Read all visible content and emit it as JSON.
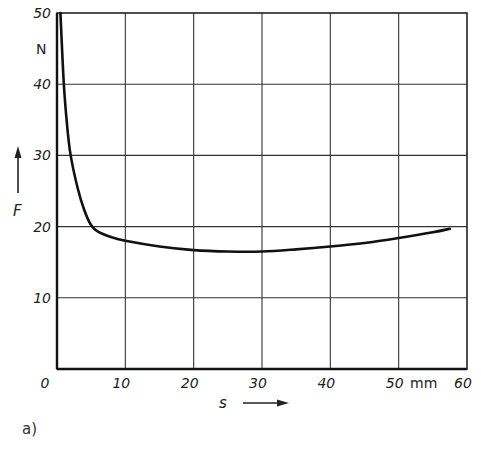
{
  "chart_data": {
    "type": "line",
    "title": "",
    "xlabel": "s",
    "xunit": "mm",
    "ylabel": "F",
    "yunit": "N",
    "xlim": [
      0,
      60
    ],
    "ylim": [
      0,
      50
    ],
    "xticks": [
      0,
      10,
      20,
      30,
      40,
      50,
      60
    ],
    "yticks": [
      10,
      20,
      30,
      40,
      50
    ],
    "grid": true,
    "series": [
      {
        "name": "F(s)",
        "x": [
          0.5,
          1,
          1.5,
          2,
          3,
          4,
          5,
          6,
          8,
          10,
          15,
          20,
          25,
          30,
          35,
          40,
          45,
          50,
          55,
          57.5
        ],
        "values": [
          50,
          40,
          34,
          30,
          25.5,
          22.3,
          20.2,
          19.3,
          18.5,
          18.0,
          17.2,
          16.7,
          16.5,
          16.5,
          16.8,
          17.2,
          17.7,
          18.4,
          19.2,
          19.7
        ]
      }
    ],
    "caption": "a)"
  },
  "labels": {
    "y_unit": "N",
    "x_unit": "mm",
    "y_axis": "F",
    "x_axis": "s",
    "caption": "a)",
    "x_ticks": [
      "0",
      "10",
      "20",
      "30",
      "40",
      "50",
      "60"
    ],
    "y_ticks": [
      "10",
      "20",
      "30",
      "40",
      "50"
    ]
  }
}
